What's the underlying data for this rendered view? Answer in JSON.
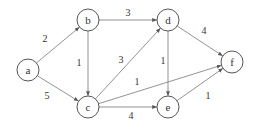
{
  "graph": {
    "directed": true,
    "nodes": [
      {
        "id": "a",
        "label": "a",
        "x": 28,
        "y": 70
      },
      {
        "id": "b",
        "label": "b",
        "x": 88,
        "y": 20
      },
      {
        "id": "c",
        "label": "c",
        "x": 88,
        "y": 107
      },
      {
        "id": "d",
        "label": "d",
        "x": 168,
        "y": 20
      },
      {
        "id": "e",
        "label": "e",
        "x": 168,
        "y": 107
      },
      {
        "id": "f",
        "label": "f",
        "x": 232,
        "y": 62
      }
    ],
    "edges": [
      {
        "from": "a",
        "to": "b",
        "weight": "2",
        "lx": 45,
        "ly": 42
      },
      {
        "from": "a",
        "to": "c",
        "weight": "5",
        "lx": 47,
        "ly": 99
      },
      {
        "from": "b",
        "to": "c",
        "weight": "1",
        "lx": 79,
        "ly": 66
      },
      {
        "from": "b",
        "to": "d",
        "weight": "3",
        "lx": 128,
        "ly": 16
      },
      {
        "from": "c",
        "to": "d",
        "weight": "3",
        "lx": 121,
        "ly": 63
      },
      {
        "from": "c",
        "to": "f",
        "weight": "1",
        "lx": 137,
        "ly": 85
      },
      {
        "from": "c",
        "to": "e",
        "weight": "4",
        "lx": 131,
        "ly": 119
      },
      {
        "from": "d",
        "to": "e",
        "weight": "1",
        "lx": 163,
        "ly": 64
      },
      {
        "from": "d",
        "to": "f",
        "weight": "4",
        "lx": 204,
        "ly": 34
      },
      {
        "from": "e",
        "to": "f",
        "weight": "1",
        "lx": 208,
        "ly": 99
      }
    ]
  }
}
